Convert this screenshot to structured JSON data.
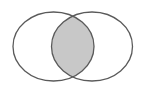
{
  "diagram": {
    "type": "venn",
    "sets": [
      {
        "id": "A",
        "label": "",
        "cx": 53.5,
        "cy": 46.5,
        "rx": 40.5,
        "ry": 34.5
      },
      {
        "id": "B",
        "label": "",
        "cx": 92,
        "cy": 46.5,
        "rx": 40.5,
        "ry": 34.5
      }
    ],
    "highlighted_region": "A∩B",
    "colors": {
      "background": "#ffffff",
      "outline": "#5a5a5a",
      "intersection_fill": "#c8c8c8",
      "set_fill": "#ffffff"
    }
  }
}
